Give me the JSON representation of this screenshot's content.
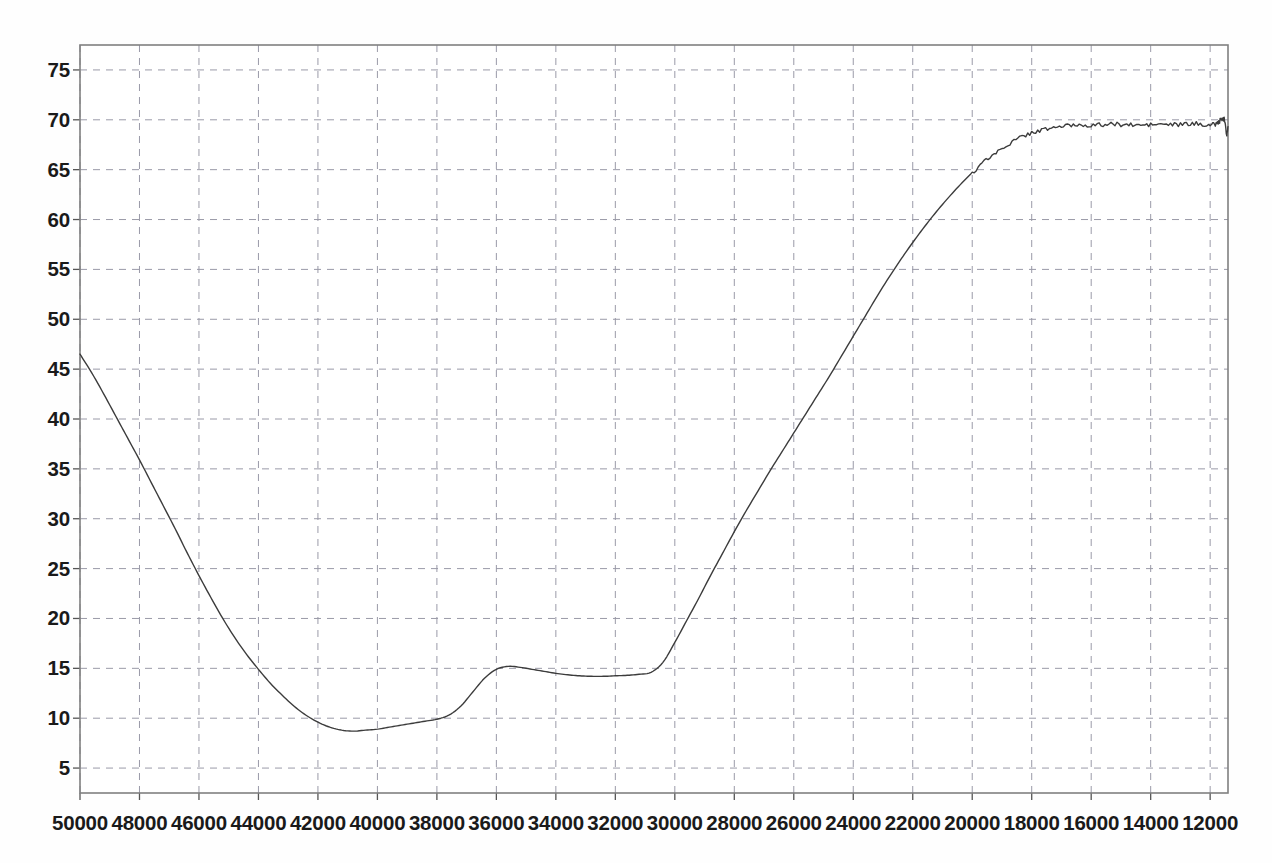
{
  "chart_data": {
    "type": "line",
    "title": "",
    "subtitle": "",
    "xlabel": "",
    "ylabel": "",
    "xlim": [
      50000,
      11400
    ],
    "ylim": [
      2.5,
      77.5
    ],
    "x_reversed": true,
    "grid": true,
    "grid_style": "dashed",
    "legend": null,
    "legend_position": "none",
    "xticks": [
      50000,
      48000,
      46000,
      44000,
      42000,
      40000,
      38000,
      36000,
      34000,
      32000,
      30000,
      28000,
      26000,
      24000,
      22000,
      20000,
      18000,
      16000,
      14000,
      12000
    ],
    "xtick_labels": [
      "50000",
      "48000",
      "46000",
      "44000",
      "42000",
      "40000",
      "38000",
      "36000",
      "34000",
      "32000",
      "30000",
      "28000",
      "26000",
      "24000",
      "22000",
      "20000",
      "18000",
      "16000",
      "14000",
      "12000"
    ],
    "yticks": [
      5,
      10,
      15,
      20,
      25,
      30,
      35,
      40,
      45,
      50,
      55,
      60,
      65,
      70,
      75
    ],
    "ytick_labels": [
      "5",
      "10",
      "15",
      "20",
      "25",
      "30",
      "35",
      "40",
      "45",
      "50",
      "55",
      "60",
      "65",
      "70",
      "75"
    ],
    "series": [
      {
        "name": "transmittance",
        "color": "#3c3c3c",
        "line_width": 1.4,
        "x": [
          50000,
          49600,
          49200,
          48800,
          48400,
          48000,
          47600,
          47200,
          46800,
          46400,
          46000,
          45600,
          45200,
          44800,
          44400,
          44000,
          43600,
          43200,
          42800,
          42400,
          42000,
          41600,
          41200,
          40800,
          40400,
          40000,
          39600,
          39200,
          38800,
          38400,
          38000,
          37600,
          37200,
          36800,
          36400,
          36000,
          35600,
          35200,
          34800,
          34400,
          34000,
          33600,
          33200,
          32800,
          32400,
          32000,
          31600,
          31200,
          30800,
          30400,
          30000,
          29600,
          29200,
          28800,
          28400,
          28000,
          27600,
          27200,
          26800,
          26400,
          26000,
          25600,
          25200,
          24800,
          24400,
          24000,
          23600,
          23200,
          22800,
          22400,
          22000,
          21600,
          21200,
          20800,
          20400,
          20000,
          19600,
          19200,
          18800,
          18400,
          18000,
          17600,
          17200,
          16800,
          16400,
          16000,
          15600,
          15200,
          14800,
          14400,
          14000,
          13600,
          13200,
          12800,
          12400,
          12000,
          11800,
          11700,
          11600,
          11500,
          11450,
          11400
        ],
        "y": [
          46.5,
          44.6,
          42.5,
          40.3,
          38.1,
          35.9,
          33.6,
          31.3,
          29.0,
          26.6,
          24.3,
          22.1,
          20.0,
          18.1,
          16.4,
          14.9,
          13.5,
          12.3,
          11.2,
          10.3,
          9.6,
          9.1,
          8.8,
          8.7,
          8.8,
          8.9,
          9.1,
          9.3,
          9.5,
          9.7,
          9.9,
          10.3,
          11.2,
          12.6,
          14.0,
          14.9,
          15.2,
          15.1,
          14.9,
          14.7,
          14.5,
          14.35,
          14.25,
          14.2,
          14.2,
          14.25,
          14.3,
          14.4,
          14.6,
          15.6,
          17.6,
          19.8,
          22.0,
          24.3,
          26.5,
          28.7,
          30.8,
          32.8,
          34.8,
          36.7,
          38.6,
          40.5,
          42.4,
          44.3,
          46.3,
          48.3,
          50.3,
          52.3,
          54.2,
          56.0,
          57.7,
          59.3,
          60.8,
          62.2,
          63.5,
          64.7,
          65.8,
          66.7,
          67.5,
          68.2,
          68.7,
          69.0,
          69.25,
          69.4,
          69.5,
          69.45,
          69.5,
          69.55,
          69.5,
          69.45,
          69.5,
          69.55,
          69.5,
          69.55,
          69.6,
          69.5,
          69.6,
          69.8,
          70.1,
          69.9,
          68.6,
          69.3
        ],
        "noise_from": 20000,
        "noise_amplitude": 0.22
      }
    ],
    "notes": {
      "start_value": 46.5,
      "global_minimum": {
        "x": 40800,
        "y": 8.7
      },
      "local_maximum": {
        "x": 38000,
        "y": 15.2
      },
      "local_shoulder": {
        "x": 32600,
        "y": 14.2
      },
      "plateau_value": 69.6,
      "plateau_starts_at": 19500,
      "terminal_dip": {
        "x": 11450,
        "y": 68.6
      }
    }
  },
  "axes": {
    "frame_color": "#808080",
    "grid_color": "#9a9aa8",
    "tick_color": "#555555",
    "background": "#fefefe"
  }
}
